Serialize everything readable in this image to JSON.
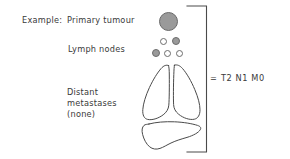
{
  "figure": {
    "background_color": "#ffffff",
    "text_color": "#3a3a3a",
    "outline_color": "#4a4a4a",
    "node_fill_color": "#9a9a9a"
  },
  "labels": {
    "example": "Example:",
    "primary_tumour": "Primary tumour",
    "lymph_nodes": "Lymph nodes",
    "distant_line1": "Distant",
    "distant_line2": "metastases",
    "distant_line3": "(none)",
    "equals": "=",
    "stage": "T2 N1 M0"
  },
  "diagram": {
    "primary_tumour": {
      "shape": "circle",
      "state": "filled",
      "fill": "#9a9a9a"
    },
    "lymph_nodes": {
      "involved_count": 2,
      "total_count": 5,
      "top_row": [
        {
          "state": "open"
        },
        {
          "state": "filled"
        }
      ],
      "bottom_row": [
        {
          "state": "filled"
        },
        {
          "state": "open"
        },
        {
          "state": "open"
        }
      ]
    },
    "organs": {
      "lungs": "lungs-outline",
      "liver": "liver-outline",
      "metastases_present": false
    },
    "bracket": {
      "orientation": "right",
      "points_to": "T2 N1 M0"
    }
  }
}
